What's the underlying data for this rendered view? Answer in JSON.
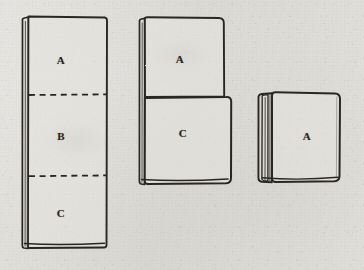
{
  "figure": {
    "background_color": "#dedcd7",
    "ink_color": "#2a2724",
    "stages": [
      {
        "name": "unfolded-strip",
        "caption": "Unfolded panel divided into three sections by dashed fold lines",
        "labels": [
          {
            "text": "A",
            "x": 61,
            "y": 60
          },
          {
            "text": "B",
            "x": 61,
            "y": 136
          },
          {
            "text": "C",
            "x": 61,
            "y": 213
          }
        ],
        "fold_lines": [
          {
            "orientation": "horizontal",
            "y": 95
          },
          {
            "orientation": "horizontal",
            "y": 176
          }
        ]
      },
      {
        "name": "half-folded",
        "caption": "Panel folded once, section A lying above section C",
        "labels": [
          {
            "text": "A",
            "x": 180,
            "y": 59
          },
          {
            "text": "C",
            "x": 183,
            "y": 133
          }
        ]
      },
      {
        "name": "fully-folded",
        "caption": "Completed fold forming a compact square with rolled spine",
        "labels": [
          {
            "text": "A",
            "x": 307,
            "y": 136
          }
        ]
      }
    ]
  }
}
